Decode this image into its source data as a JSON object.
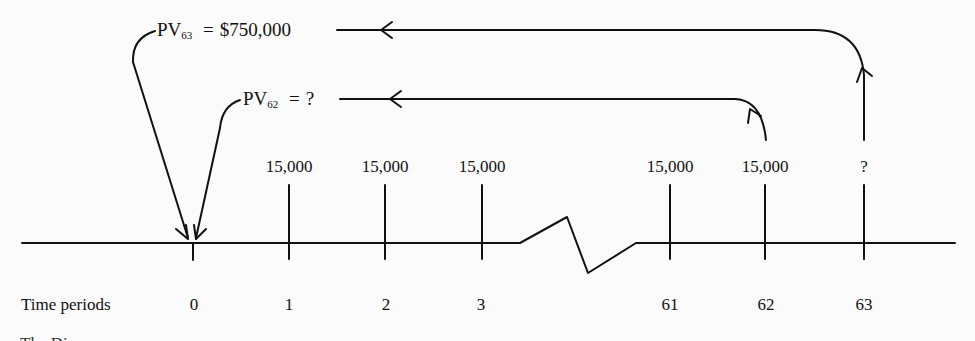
{
  "diagram": {
    "type": "cash-flow timeline",
    "annotations": {
      "pv63": {
        "prefix": "PV",
        "subscript": "63",
        "equals": "=",
        "value": "$750,000"
      },
      "pv62": {
        "prefix": "PV",
        "subscript": "62",
        "equals": "=",
        "value": "?"
      }
    },
    "axis_label": "Time periods",
    "periods": [
      {
        "label": "0",
        "cash_flow": ""
      },
      {
        "label": "1",
        "cash_flow": "15,000"
      },
      {
        "label": "2",
        "cash_flow": "15,000"
      },
      {
        "label": "3",
        "cash_flow": "15,000"
      },
      {
        "label": "61",
        "cash_flow": "15,000"
      },
      {
        "label": "62",
        "cash_flow": "15,000"
      },
      {
        "label": "63",
        "cash_flow": "?"
      }
    ],
    "break_marker": "time-axis-break",
    "caption_fragment": "The Di..."
  },
  "colors": {
    "ink": "#111111",
    "background": "#fbfbfb"
  }
}
